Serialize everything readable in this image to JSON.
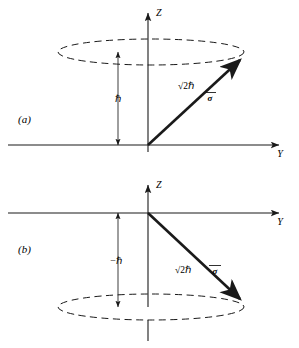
{
  "figure": {
    "background_color": "#ffffff",
    "stroke_color": "#1a1a1a",
    "panels": [
      {
        "tag": "(a)",
        "tag_name": "panel-a-tag",
        "z_axis_label": "Z",
        "y_axis_label": "Y",
        "vector_label": "σ",
        "magnitude_label": "√2ℏ",
        "projection_label": "ℏ",
        "origin": {
          "x": 148,
          "y": 145
        },
        "z_axis": {
          "x": 148,
          "y_top": 10,
          "y_bottom": 152
        },
        "y_axis": {
          "y": 145,
          "x_left": 8,
          "x_right": 283
        },
        "cone_ellipse": {
          "cx": 151,
          "cy": 52,
          "rx": 93,
          "ry": 13
        },
        "vector_tip": {
          "x": 243,
          "y": 57
        },
        "dimension_line": {
          "x": 118,
          "y_top": 52,
          "y_bottom": 145
        }
      },
      {
        "tag": "(b)",
        "tag_name": "panel-b-tag",
        "z_axis_label": "Z",
        "y_axis_label": "Y",
        "vector_label": "σ",
        "magnitude_label": "√2ℏ",
        "projection_label": "−ℏ",
        "origin": {
          "x": 148,
          "y": 213
        },
        "z_axis": {
          "x": 148,
          "y_top": 182,
          "y_bottom": 340
        },
        "y_axis": {
          "y": 213,
          "x_left": 8,
          "x_right": 283
        },
        "cone_ellipse": {
          "cx": 151,
          "cy": 307,
          "rx": 93,
          "ry": 13
        },
        "vector_tip": {
          "x": 243,
          "y": 302
        },
        "dimension_line": {
          "x": 118,
          "y_top": 213,
          "y_bottom": 307
        }
      }
    ],
    "caption_alt": "Spin angular momentum vector of magnitude √2ℏ precessing about the Z axis with projection +ℏ (a) and −ℏ (b)."
  }
}
